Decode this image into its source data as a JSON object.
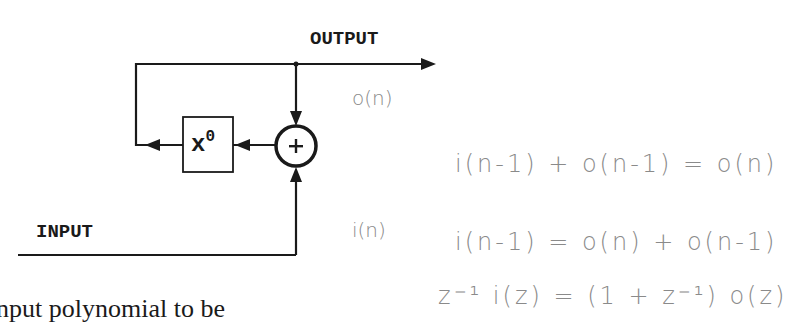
{
  "diagram": {
    "labels": {
      "output": "OUTPUT",
      "input": "INPUT",
      "delay_box_base": "x",
      "delay_box_exponent": "0",
      "adder_symbol": "+"
    },
    "annotations": {
      "output_signal": "o(n)",
      "input_signal": "i(n)"
    },
    "nodes": [
      {
        "id": "adder",
        "type": "circle",
        "symbol": "+"
      },
      {
        "id": "delay",
        "type": "box",
        "label": "x^0"
      }
    ],
    "edges": [
      {
        "from": "adder",
        "to": "output",
        "label": "OUTPUT"
      },
      {
        "from": "output-junction",
        "to": "adder",
        "label": "o(n)"
      },
      {
        "from": "input",
        "to": "adder",
        "label": "i(n)"
      },
      {
        "from": "adder",
        "to": "delay"
      },
      {
        "from": "delay",
        "to": "feedback-left"
      },
      {
        "from": "feedback-left",
        "to": "output-line"
      }
    ]
  },
  "handwritten_equations": [
    "i(n-1) + o(n-1) = o(n)",
    "i(n-1) = o(n) + o(n-1)",
    "z⁻¹ i(z) = (1 + z⁻¹) o(z)"
  ],
  "caption_fragment": "nput polynomial to be",
  "colors": {
    "ink": "#1a1a1a",
    "pencil": "#8a8a8a",
    "background": "#ffffff"
  }
}
